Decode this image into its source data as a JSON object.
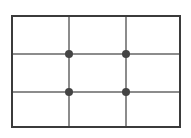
{
  "diagram": {
    "type": "composition-guide",
    "background_color": "#ffffff",
    "frame": {
      "label": "Image frame",
      "border_color": "#3b3b3b",
      "border_width_px": 2,
      "fill_color": "#ffffff",
      "x_px": 11,
      "y_px": 15,
      "width_px": 170,
      "height_px": 113
    },
    "grid": {
      "columns": 3,
      "rows": 3,
      "line_color": "#8c8c8c",
      "line_width_px": 2,
      "vertical_lines": [
        {
          "label": "Left third line",
          "offset_px": 55
        },
        {
          "label": "Right third line",
          "offset_px": 112
        }
      ],
      "horizontal_lines": [
        {
          "label": "Upper third line",
          "offset_px": 36
        },
        {
          "label": "Lower third line",
          "offset_px": 74
        }
      ]
    },
    "intersection_points": {
      "label": "Power points",
      "count": 4,
      "color": "#444444",
      "diameter_px": 8,
      "points": [
        {
          "label": "Top-left power point",
          "x_px": 56,
          "y_px": 37
        },
        {
          "label": "Top-right power point",
          "x_px": 113,
          "y_px": 37
        },
        {
          "label": "Bottom-left power point",
          "x_px": 56,
          "y_px": 75
        },
        {
          "label": "Bottom-right power point",
          "x_px": 113,
          "y_px": 75
        }
      ]
    },
    "cells": [
      {
        "label": "Cell row 1 column 1"
      },
      {
        "label": "Cell row 1 column 2"
      },
      {
        "label": "Cell row 1 column 3"
      },
      {
        "label": "Cell row 2 column 1"
      },
      {
        "label": "Cell row 2 column 2"
      },
      {
        "label": "Cell row 2 column 3"
      },
      {
        "label": "Cell row 3 column 1"
      },
      {
        "label": "Cell row 3 column 2"
      },
      {
        "label": "Cell row 3 column 3"
      }
    ]
  }
}
